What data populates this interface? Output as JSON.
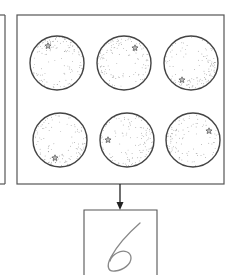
{
  "diagram": {
    "stroke_color": "#555555",
    "dot_color": "#888888",
    "left_panel": {
      "visible_edge_x": 5,
      "top": 15,
      "bottom": 184
    },
    "main_frame": {
      "x": 17,
      "y": 15,
      "w": 207,
      "h": 169
    },
    "circles": [
      {
        "id": 1,
        "cx": 57,
        "cy": 63,
        "r": 27,
        "star": {
          "x": 48,
          "y": 46
        },
        "shade_angle": 60
      },
      {
        "id": 2,
        "cx": 124,
        "cy": 63,
        "r": 27,
        "star": {
          "x": 135,
          "y": 48
        },
        "shade_angle": 135
      },
      {
        "id": 3,
        "cx": 191,
        "cy": 63,
        "r": 27,
        "star": {
          "x": 182,
          "y": 80
        },
        "shade_angle": -45
      },
      {
        "id": 4,
        "cx": 60,
        "cy": 140,
        "r": 27,
        "star": {
          "x": 55,
          "y": 158
        },
        "shade_angle": -80
      },
      {
        "id": 5,
        "cx": 127,
        "cy": 140,
        "r": 27,
        "star": {
          "x": 108,
          "y": 140
        },
        "shade_angle": 0
      },
      {
        "id": 6,
        "cx": 193,
        "cy": 140,
        "r": 27,
        "star": {
          "x": 209,
          "y": 131
        },
        "shade_angle": 180
      }
    ],
    "arrow": {
      "x": 120,
      "y1": 184,
      "y2": 210
    },
    "output_box": {
      "x": 84,
      "y": 210,
      "w": 73,
      "h": 65,
      "digit": "6"
    }
  }
}
